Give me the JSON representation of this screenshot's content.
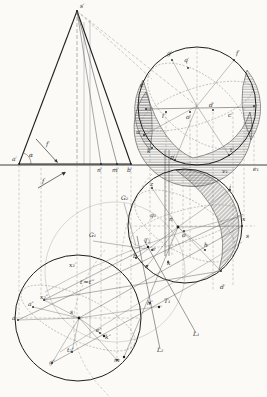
{
  "figure": {
    "paper_color": "#fbfaf7",
    "ink_color": "#2b2b2b",
    "construction_color": "#8a8a8a",
    "hatch_color": "#474747"
  },
  "arrows": {
    "front_direction_label": "f′",
    "top_direction_label": "f"
  },
  "labels": [
    {
      "text": "s′",
      "x": 80,
      "y": 8
    },
    {
      "text": "α",
      "x": 29,
      "y": 157
    },
    {
      "text": "f′",
      "x": 46,
      "y": 146
    },
    {
      "text": "a′",
      "x": 12,
      "y": 161
    },
    {
      "text": "n′",
      "x": 97,
      "y": 172
    },
    {
      "text": "m′",
      "x": 112,
      "y": 172
    },
    {
      "text": "b′",
      "x": 127,
      "y": 172
    },
    {
      "text": "f",
      "x": 42,
      "y": 183
    },
    {
      "text": "g′",
      "x": 167,
      "y": 55
    },
    {
      "text": "q′",
      "x": 184,
      "y": 62
    },
    {
      "text": "f′",
      "x": 236,
      "y": 55
    },
    {
      "text": "e′",
      "x": 140,
      "y": 87
    },
    {
      "text": "u′",
      "x": 136,
      "y": 134
    },
    {
      "text": "k′",
      "x": 147,
      "y": 153
    },
    {
      "text": "l′",
      "x": 162,
      "y": 118
    },
    {
      "text": "o′",
      "x": 186,
      "y": 119
    },
    {
      "text": "d′",
      "x": 209,
      "y": 107
    },
    {
      "text": "c′",
      "x": 228,
      "y": 117
    },
    {
      "text": "p′",
      "x": 170,
      "y": 159
    },
    {
      "text": "t′",
      "x": 230,
      "y": 152
    },
    {
      "text": "v₁",
      "x": 222,
      "y": 173
    },
    {
      "text": "e₁",
      "x": 253,
      "y": 171
    },
    {
      "text": "z",
      "x": 150,
      "y": 186
    },
    {
      "text": "j",
      "x": 229,
      "y": 189
    },
    {
      "text": "x",
      "x": 242,
      "y": 221
    },
    {
      "text": "s",
      "x": 246,
      "y": 238
    },
    {
      "text": "g₁",
      "x": 150,
      "y": 217
    },
    {
      "text": "n",
      "x": 169,
      "y": 221
    },
    {
      "text": "o",
      "x": 182,
      "y": 237
    },
    {
      "text": "h",
      "x": 204,
      "y": 247
    },
    {
      "text": "e",
      "x": 152,
      "y": 251
    },
    {
      "text": "c",
      "x": 145,
      "y": 268
    },
    {
      "text": "k",
      "x": 167,
      "y": 265
    },
    {
      "text": "b",
      "x": 133,
      "y": 258
    },
    {
      "text": "d′",
      "x": 220,
      "y": 289
    },
    {
      "text": "G₁",
      "x": 89,
      "y": 237
    },
    {
      "text": "G₂",
      "x": 121,
      "y": 200
    },
    {
      "text": "T₂",
      "x": 144,
      "y": 243
    },
    {
      "text": "T₁",
      "x": 164,
      "y": 303
    },
    {
      "text": "h″",
      "x": 147,
      "y": 305
    },
    {
      "text": "L₁",
      "x": 193,
      "y": 336
    },
    {
      "text": "L₂",
      "x": 157,
      "y": 352
    },
    {
      "text": "a",
      "x": 12,
      "y": 320
    },
    {
      "text": "s",
      "x": 70,
      "y": 314
    },
    {
      "text": "x₂″",
      "x": 40,
      "y": 299
    },
    {
      "text": "a″",
      "x": 28,
      "y": 306
    },
    {
      "text": "x₂′",
      "x": 69,
      "y": 267
    },
    {
      "text": "t′=t‴",
      "x": 80,
      "y": 284
    },
    {
      "text": "g″",
      "x": 49,
      "y": 364
    },
    {
      "text": "t₂″",
      "x": 67,
      "y": 352
    },
    {
      "text": "m",
      "x": 114,
      "y": 362
    },
    {
      "text": "k″",
      "x": 105,
      "y": 339
    },
    {
      "text": "e″",
      "x": 96,
      "y": 332
    }
  ]
}
